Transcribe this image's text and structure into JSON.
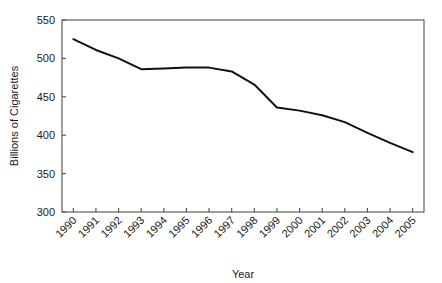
{
  "chart_data": {
    "type": "line",
    "title": "",
    "subtitle": "",
    "xlabel": "Year",
    "ylabel": "Billions of Cigarettes",
    "categories": [
      "1990",
      "1991",
      "1992",
      "1993",
      "1994",
      "1995",
      "1996",
      "1997",
      "1998",
      "1999",
      "2000",
      "2001",
      "2002",
      "2003",
      "2004",
      "2005"
    ],
    "x": [
      1990,
      1991,
      1992,
      1993,
      1994,
      1995,
      1996,
      1997,
      1998,
      1999,
      2000,
      2001,
      2002,
      2003,
      2004,
      2005
    ],
    "series": [
      {
        "name": "Billions of Cigarettes",
        "values": [
          525,
          511,
          500,
          486,
          487,
          488,
          488,
          483,
          466,
          436,
          432,
          426,
          417,
          403,
          390,
          378
        ],
        "color": "#111111"
      }
    ],
    "ylim": [
      300,
      550
    ],
    "yticks": [
      300,
      350,
      400,
      450,
      500,
      550
    ],
    "ytick_labels": [
      "300",
      "350",
      "400",
      "450",
      "500",
      "550"
    ],
    "xlim": [
      1989.5,
      2005.5
    ],
    "grid": false,
    "legend": false,
    "legend_position": "none",
    "xtick_rotation_degrees": 45,
    "plot_frame": true,
    "background_color": "#ffffff",
    "axis_color": "#4d4d4d"
  }
}
